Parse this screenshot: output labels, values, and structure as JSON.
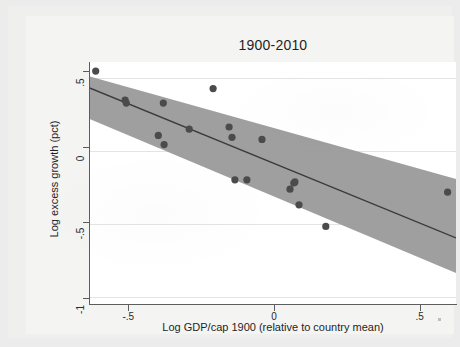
{
  "chart_data": {
    "type": "scatter",
    "title": "1900-2010",
    "xlabel": "Log GDP/cap 1900 (relative to country mean)",
    "ylabel": "Log excess growth (pct)",
    "xlim": [
      -0.635,
      0.625
    ],
    "ylim": [
      -1.04,
      0.56
    ],
    "xticks": [
      -0.5,
      0,
      0.5
    ],
    "xticklabels": [
      "-.5",
      "0",
      ".5"
    ],
    "yticks": [
      0.5,
      0,
      -0.5,
      -1
    ],
    "yticklabels": [
      ".5",
      "0",
      "-.5",
      "-1"
    ],
    "grid": "horizontal-faint",
    "legend": "none",
    "marker_color": "#4b4b4b",
    "band_color": "#9a9a9a",
    "fit_line_color": "#3a3a3a",
    "points": [
      {
        "x": -0.612,
        "y": 0.5
      },
      {
        "x": -0.511,
        "y": 0.308
      },
      {
        "x": -0.507,
        "y": 0.288
      },
      {
        "x": -0.397,
        "y": 0.075
      },
      {
        "x": -0.377,
        "y": 0.014
      },
      {
        "x": -0.38,
        "y": 0.288
      },
      {
        "x": -0.291,
        "y": 0.116
      },
      {
        "x": -0.209,
        "y": 0.384
      },
      {
        "x": -0.154,
        "y": 0.13
      },
      {
        "x": -0.144,
        "y": 0.062
      },
      {
        "x": -0.041,
        "y": 0.048
      },
      {
        "x": -0.134,
        "y": -0.219
      },
      {
        "x": -0.093,
        "y": -0.219
      },
      {
        "x": 0.068,
        "y": -0.24
      },
      {
        "x": 0.072,
        "y": -0.233
      },
      {
        "x": 0.055,
        "y": -0.281
      },
      {
        "x": 0.086,
        "y": -0.384
      },
      {
        "x": 0.178,
        "y": -0.527
      },
      {
        "x": 0.596,
        "y": -0.301
      }
    ],
    "fit_line": {
      "x0": -0.635,
      "y0": 0.39,
      "x1": 0.625,
      "y1": -0.603
    },
    "confidence_band": {
      "x0": -0.635,
      "upper0": 0.466,
      "lower0": 0.185,
      "x1": 0.625,
      "upper1": -0.213,
      "lower1": -0.836
    }
  },
  "figure": {
    "background": "#ececec",
    "plot_background": "#ffffff"
  }
}
